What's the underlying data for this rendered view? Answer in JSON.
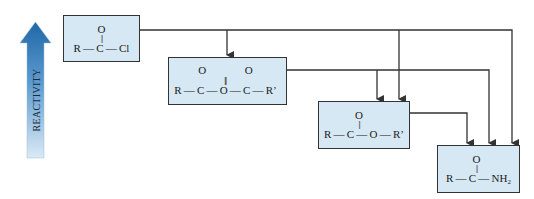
{
  "reactivity_arrow": {
    "label": "REACTIVITY",
    "direction": "up",
    "color_top": "#1f68a6",
    "color_bottom": "#dbeaf6"
  },
  "colors": {
    "box_fill": "#d5e8f4",
    "box_border": "#333333",
    "line": "#333333"
  },
  "compounds": [
    {
      "id": "acid-chloride",
      "name": "Acid chloride",
      "o_row": "O",
      "bond_row": "||",
      "main_row": "R — C — Cl"
    },
    {
      "id": "anhydride",
      "name": "Acid anhydride",
      "o_row": "O              O",
      "bond_row": "||              ||",
      "main_row": "R — C — O — C — R’"
    },
    {
      "id": "ester",
      "name": "Ester",
      "o_row": "O",
      "bond_row": "||",
      "main_row": "R — C — O — R’"
    },
    {
      "id": "amide",
      "name": "Amide",
      "o_row": "O",
      "bond_row": "||",
      "main_row_prefix": "R — C — NH",
      "main_row_sub": "2"
    }
  ],
  "conversions": [
    {
      "from": "acid-chloride",
      "to": "anhydride"
    },
    {
      "from": "acid-chloride",
      "to": "ester"
    },
    {
      "from": "acid-chloride",
      "to": "amide"
    },
    {
      "from": "anhydride",
      "to": "ester"
    },
    {
      "from": "anhydride",
      "to": "amide"
    },
    {
      "from": "ester",
      "to": "amide"
    }
  ]
}
